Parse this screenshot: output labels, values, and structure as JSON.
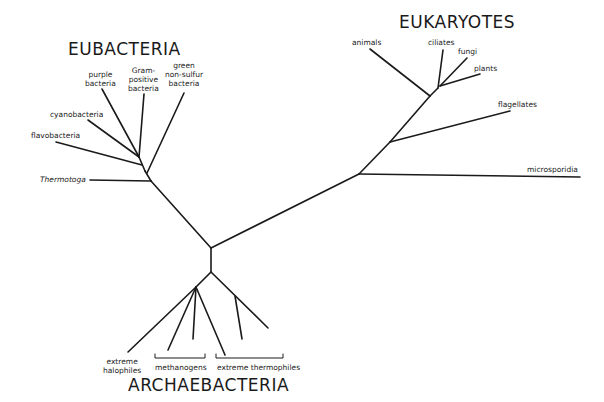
{
  "diagram": {
    "type": "unrooted phylogenetic tree",
    "groups": {
      "eubacteria": "EUBACTERIA",
      "eukaryotes": "EUKARYOTES",
      "archaebacteria": "ARCHAEBACTERIA"
    },
    "eubacteria_taxa": {
      "purple": [
        "purple",
        "bacteria"
      ],
      "gram": [
        "Gram-",
        "positive",
        "bacteria"
      ],
      "green": [
        "green",
        "non-sulfur",
        "bacteria"
      ],
      "cyanobacteria": "cyanobacteria",
      "flavobacteria": "flavobacteria",
      "thermotoga": "Thermotoga"
    },
    "eukaryote_taxa": {
      "animals": "animals",
      "ciliates": "ciliates",
      "fungi": "fungi",
      "plants": "plants",
      "flagellates": "flagellates",
      "microsporidia": "microsporidia"
    },
    "archaebacteria_taxa": {
      "halophiles": [
        "extreme",
        "halophiles"
      ],
      "methanogens": "methanogens",
      "thermophiles": "extreme thermophiles"
    }
  }
}
